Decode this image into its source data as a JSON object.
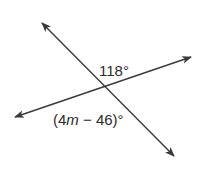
{
  "diagram": {
    "type": "intersecting-lines",
    "line_color": "#3a3a3a",
    "lines": [
      {
        "name": "line-a",
        "from": [
          42,
          23
        ],
        "to": [
          174,
          156
        ],
        "arrows": "both"
      },
      {
        "name": "line-b",
        "from": [
          15,
          117
        ],
        "to": [
          191,
          57
        ],
        "arrows": "both"
      }
    ],
    "intersection": [
      105,
      87
    ],
    "labels": {
      "angle_top": "118°",
      "angle_bottom_pre": "(4",
      "angle_bottom_var": "m",
      "angle_bottom_post": " − 46)°"
    }
  }
}
